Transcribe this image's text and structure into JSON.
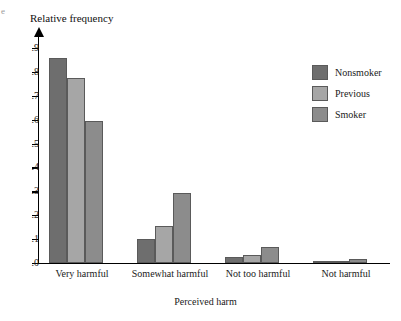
{
  "figure": {
    "corner_mark": "e",
    "plot": {
      "x0": 38,
      "y_top": 36,
      "y_baseline": 263,
      "width": 352,
      "height": 227
    }
  },
  "chart_data": {
    "type": "bar",
    "title": "",
    "ylabel": "Relative frequency",
    "xlabel": "Perceived harm",
    "categories": [
      "Very harmful",
      "Somewhat harmful",
      "Not too harmful",
      "Not harmful"
    ],
    "series": [
      {
        "name": "Nonsmoker",
        "color": "#6e6e6e",
        "values": [
          0.86,
          0.1,
          0.025,
          0.005
        ]
      },
      {
        "name": "Previous",
        "color": "#a6a6a6",
        "values": [
          0.775,
          0.155,
          0.035,
          0.008
        ]
      },
      {
        "name": "Smoker",
        "color": "#8c8c8c",
        "values": [
          0.595,
          0.295,
          0.065,
          0.018
        ]
      }
    ],
    "ylim": [
      0,
      0.95
    ],
    "yticks": [
      0.0,
      0.1,
      0.2,
      0.3,
      0.4,
      0.5,
      0.6,
      0.7,
      0.8,
      0.9
    ],
    "ytick_labels": [
      ".0",
      ".1",
      ".2",
      ".3",
      ".4",
      ".5",
      ".6",
      ".7",
      ".8",
      ".9"
    ],
    "grid": false,
    "legend_position": "right-top"
  },
  "legend": {
    "items": [
      {
        "label": "Nonsmoker",
        "color": "#6e6e6e"
      },
      {
        "label": "Previous",
        "color": "#a6a6a6"
      },
      {
        "label": "Smoker",
        "color": "#8c8c8c"
      }
    ]
  }
}
